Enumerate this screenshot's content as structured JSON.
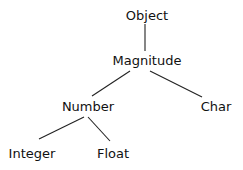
{
  "diagram": {
    "type": "class-hierarchy-tree",
    "nodes": {
      "object": {
        "label": "Object",
        "x": 147,
        "y": 8
      },
      "magnitude": {
        "label": "Magnitude",
        "x": 147,
        "y": 53
      },
      "number": {
        "label": "Number",
        "x": 88,
        "y": 99
      },
      "char": {
        "label": "Char",
        "x": 216,
        "y": 99
      },
      "integer": {
        "label": "Integer",
        "x": 32,
        "y": 146
      },
      "float": {
        "label": "Float",
        "x": 113,
        "y": 146
      }
    },
    "edges": [
      {
        "from": "Object",
        "to": "Magnitude"
      },
      {
        "from": "Magnitude",
        "to": "Number"
      },
      {
        "from": "Magnitude",
        "to": "Char"
      },
      {
        "from": "Number",
        "to": "Integer"
      },
      {
        "from": "Number",
        "to": "Float"
      }
    ],
    "colors": {
      "background": "#ffffff",
      "text": "#111111",
      "edge": "#222222"
    }
  }
}
